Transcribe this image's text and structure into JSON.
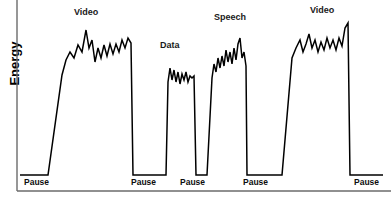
{
  "axes": {
    "ylabel": "Energy",
    "xlabel": "",
    "frame_color": "#6b6b6b",
    "line_color": "#000000"
  },
  "burst_labels": [
    {
      "text": "Video",
      "x": 74,
      "y": 7
    },
    {
      "text": "Data",
      "x": 160,
      "y": 40
    },
    {
      "text": "Speech",
      "x": 214,
      "y": 12
    },
    {
      "text": "Video",
      "x": 310,
      "y": 5
    }
  ],
  "pause_labels": [
    {
      "text": "Pause",
      "x": 24,
      "y": 177
    },
    {
      "text": "Pause",
      "x": 131,
      "y": 177
    },
    {
      "text": "Pause",
      "x": 180,
      "y": 177
    },
    {
      "text": "Pause",
      "x": 243,
      "y": 177
    },
    {
      "text": "Pause",
      "x": 354,
      "y": 177
    }
  ],
  "chart_data": {
    "type": "line",
    "title": "",
    "xlabel": "Time",
    "ylabel": "Energy",
    "grid": false,
    "legend": "none",
    "baseline_y": 175,
    "xlim": [
      17,
      392
    ],
    "ylim": [
      190,
      10
    ],
    "segments": [
      {
        "name": "Pause",
        "type": "idle",
        "x_start": 20,
        "x_end": 48,
        "level": 175
      },
      {
        "name": "Video",
        "type": "burst",
        "x_start": 48,
        "x_end": 133,
        "peak_y": 30,
        "plateau_y": 45
      },
      {
        "name": "Pause",
        "type": "idle",
        "x_start": 133,
        "x_end": 163,
        "level": 175
      },
      {
        "name": "Data",
        "type": "burst",
        "x_start": 163,
        "x_end": 198,
        "peak_y": 66,
        "plateau_y": 76
      },
      {
        "name": "Pause",
        "type": "idle",
        "x_start": 198,
        "x_end": 207,
        "level": 175
      },
      {
        "name": "Speech",
        "type": "burst",
        "x_start": 207,
        "x_end": 247,
        "peak_y": 38,
        "plateau_y": 55
      },
      {
        "name": "Pause",
        "type": "idle",
        "x_start": 247,
        "x_end": 282,
        "level": 175
      },
      {
        "name": "Video",
        "type": "burst",
        "x_start": 282,
        "x_end": 350,
        "peak_y": 23,
        "plateau_y": 40
      },
      {
        "name": "Pause",
        "type": "idle",
        "x_start": 350,
        "x_end": 383,
        "level": 175
      }
    ],
    "polyline_points": "20,175 48,175 62,75 66,60 70,52 74,58 78,45 82,52 86,30 89,48 92,40 95,62 98,48 101,58 104,45 107,56 110,44 113,54 116,44 119,52 122,40 125,48 128,38 131,43 133,175 163,175 166,175 168,82 170,68 172,80 174,70 176,82 178,72 180,84 182,74 184,80 186,72 188,82 190,76 192,78 194,76 196,175 198,175 207,175 212,78 214,64 216,72 218,58 220,68 222,56 224,66 226,50 228,62 230,52 232,64 234,48 236,60 238,44 240,38 242,58 244,52 246,66 247,175 282,175 292,58 296,48 300,40 303,52 306,44 309,34 312,48 315,40 318,52 321,42 324,50 327,38 330,48 333,40 336,50 339,38 342,46 345,28 348,23 350,175 383,175",
    "series": [
      {
        "name": "energy",
        "x": [
          20,
          48,
          62,
          66,
          70,
          74,
          78,
          82,
          86,
          89,
          92,
          95,
          98,
          101,
          104,
          107,
          110,
          113,
          116,
          119,
          122,
          125,
          128,
          131,
          133,
          163,
          166,
          168,
          170,
          172,
          174,
          176,
          178,
          180,
          182,
          184,
          186,
          188,
          190,
          192,
          194,
          196,
          198,
          207,
          212,
          214,
          216,
          218,
          220,
          222,
          224,
          226,
          228,
          230,
          232,
          234,
          236,
          238,
          240,
          242,
          244,
          246,
          247,
          282,
          292,
          296,
          300,
          303,
          306,
          309,
          312,
          315,
          318,
          321,
          324,
          327,
          330,
          333,
          336,
          339,
          342,
          345,
          348,
          350,
          383
        ],
        "y": [
          175,
          175,
          75,
          60,
          52,
          58,
          45,
          52,
          30,
          48,
          40,
          62,
          48,
          58,
          45,
          56,
          44,
          54,
          44,
          52,
          40,
          48,
          38,
          43,
          175,
          175,
          175,
          82,
          68,
          80,
          70,
          82,
          72,
          84,
          74,
          80,
          72,
          82,
          76,
          78,
          76,
          175,
          175,
          175,
          78,
          64,
          72,
          58,
          68,
          56,
          66,
          50,
          62,
          52,
          64,
          48,
          60,
          44,
          38,
          58,
          52,
          66,
          175,
          175,
          58,
          48,
          40,
          52,
          44,
          34,
          48,
          40,
          52,
          42,
          50,
          38,
          48,
          40,
          50,
          38,
          46,
          28,
          23,
          175,
          175
        ]
      }
    ]
  }
}
